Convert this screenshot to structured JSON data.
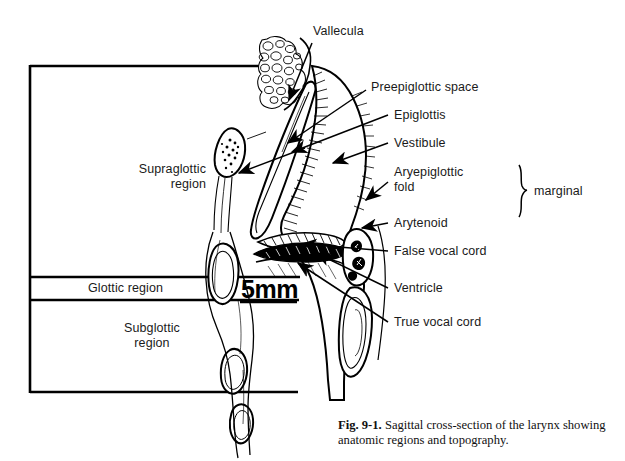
{
  "figure": {
    "caption_number": "Fig. 9-1.",
    "caption_text": " Sagittal cross-section of the larynx showing anatomic regions and topography."
  },
  "scale": {
    "value": "5mm"
  },
  "region_labels": [
    {
      "name": "supraglottic-region",
      "text": "Supraglottic\nregion"
    },
    {
      "name": "glottic-region",
      "text": "Glottic region"
    },
    {
      "name": "subglottic-region",
      "text": "Subglottic\nregion"
    }
  ],
  "structure_labels": [
    {
      "name": "vallecula",
      "text": "Vallecula"
    },
    {
      "name": "preepiglottic-space",
      "text": "Preepiglottic space"
    },
    {
      "name": "epiglottis",
      "text": "Epiglottis"
    },
    {
      "name": "vestibule",
      "text": "Vestibule"
    },
    {
      "name": "aryepiglottic-fold",
      "text": "Aryepiglottic\nfold"
    },
    {
      "name": "arytenoid",
      "text": "Arytenoid"
    },
    {
      "name": "false-vocal-cord",
      "text": "False vocal cord"
    },
    {
      "name": "ventricle",
      "text": "Ventricle"
    },
    {
      "name": "true-vocal-cord",
      "text": "True vocal cord"
    }
  ],
  "bracket_label": {
    "name": "marginal",
    "text": "marginal"
  },
  "colors": {
    "ink": "#000000",
    "background": "#ffffff",
    "label_text": "#1a1a1a"
  }
}
